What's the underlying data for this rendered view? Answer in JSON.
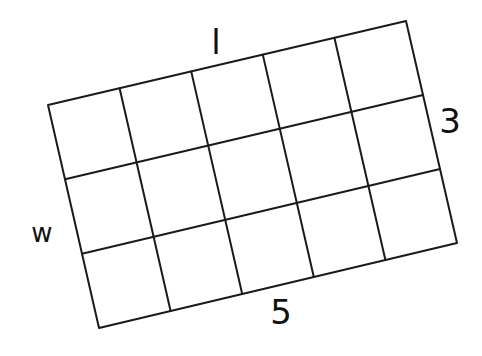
{
  "diagram": {
    "type": "grid-rectangle",
    "columns": 5,
    "rows": 3,
    "stroke_color": "#1a1a1a",
    "stroke_width": 2,
    "corners": {
      "top_left": [
        48,
        105
      ],
      "top_right": [
        406,
        21
      ],
      "bottom_right": [
        457,
        243
      ],
      "bottom_left": [
        99,
        328
      ]
    }
  },
  "labels": {
    "length_symbol": {
      "text": "l",
      "x": 216,
      "y": 42,
      "size": 34
    },
    "width_value": {
      "text": "3",
      "x": 450,
      "y": 121,
      "size": 34
    },
    "width_symbol": {
      "text": "w",
      "x": 42,
      "y": 233,
      "size": 26
    },
    "length_value": {
      "text": "5",
      "x": 281,
      "y": 312,
      "size": 34
    }
  }
}
